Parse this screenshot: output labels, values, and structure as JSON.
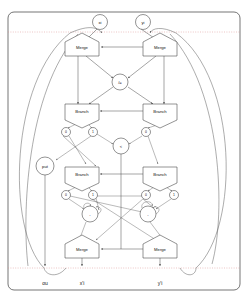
{
  "diagram": {
    "frame": {
      "x": 8,
      "y": 12,
      "w": 232,
      "h": 278,
      "corner": 6
    },
    "colors": {
      "node_stroke": "#3a3a3a",
      "edge": "#4a4a4a",
      "dotted_boundary": "#d98a8a",
      "frame": "#3a3a3a",
      "background": "#ffffff",
      "text": "#111111"
    },
    "boundaries": [
      {
        "name": "top-boundary",
        "y": 32
      },
      {
        "name": "bottom-boundary",
        "y": 268
      }
    ],
    "inputs": [
      {
        "id": "xi",
        "label": "xi",
        "cx": 100,
        "cy": 22,
        "r": 7.5
      },
      {
        "id": "yi",
        "label": "yi",
        "cx": 143,
        "cy": 22,
        "r": 7.5
      }
    ],
    "outputs": [
      {
        "id": "ou",
        "label": "ou",
        "x": 45,
        "y": 285
      },
      {
        "id": "xout",
        "label": "x'i",
        "x": 94,
        "y": 285
      },
      {
        "id": "yout",
        "label": "y'i",
        "x": 159,
        "y": 285
      }
    ],
    "nodes": [
      {
        "id": "merge-top-left",
        "type": "merge",
        "label": "Merge",
        "cx": 82,
        "cy": 47
      },
      {
        "id": "merge-top-right",
        "type": "merge",
        "label": "Merge",
        "cx": 160,
        "cy": 47
      },
      {
        "id": "neq",
        "type": "op",
        "label": "/=",
        "cx": 120,
        "cy": 82,
        "r": 8
      },
      {
        "id": "branch-upper-left",
        "type": "branch",
        "label": "Branch",
        "cx": 82,
        "cy": 111
      },
      {
        "id": "branch-upper-right",
        "type": "branch",
        "label": "Branch",
        "cx": 160,
        "cy": 111
      },
      {
        "id": "port-ul-0",
        "type": "port",
        "label": "0",
        "cx": 66,
        "cy": 132,
        "r": 4.5
      },
      {
        "id": "port-ul-1",
        "type": "port",
        "label": "1",
        "cx": 93,
        "cy": 132,
        "r": 4.5
      },
      {
        "id": "port-ur-0",
        "type": "port",
        "label": "0",
        "cx": 146,
        "cy": 132,
        "r": 4.5
      },
      {
        "id": "less-than",
        "type": "op",
        "label": "<",
        "cx": 121,
        "cy": 146,
        "r": 8
      },
      {
        "id": "put",
        "type": "op",
        "label": "put",
        "cx": 45,
        "cy": 166,
        "r": 9
      },
      {
        "id": "branch-lower-left",
        "type": "branch",
        "label": "Branch",
        "cx": 82,
        "cy": 174
      },
      {
        "id": "branch-lower-right",
        "type": "branch",
        "label": "Branch",
        "cx": 160,
        "cy": 174
      },
      {
        "id": "port-ll-0",
        "type": "port",
        "label": "0",
        "cx": 66,
        "cy": 195,
        "r": 4.5
      },
      {
        "id": "port-ll-1",
        "type": "port",
        "label": "1",
        "cx": 93,
        "cy": 195,
        "r": 4.5
      },
      {
        "id": "port-lr-0",
        "type": "port",
        "label": "0",
        "cx": 146,
        "cy": 195,
        "r": 4.5
      },
      {
        "id": "port-lr-1",
        "type": "port",
        "label": "1",
        "cx": 174,
        "cy": 195,
        "r": 4.5
      },
      {
        "id": "sub-left",
        "type": "op",
        "label": "-",
        "cx": 90,
        "cy": 214,
        "r": 8
      },
      {
        "id": "sub-right",
        "type": "op",
        "label": "-",
        "cx": 148,
        "cy": 214,
        "r": 8
      },
      {
        "id": "merge-bottom-left",
        "type": "merge",
        "label": "Merge",
        "cx": 82,
        "cy": 249
      },
      {
        "id": "merge-bottom-right",
        "type": "merge",
        "label": "Merge",
        "cx": 160,
        "cy": 249
      }
    ]
  }
}
